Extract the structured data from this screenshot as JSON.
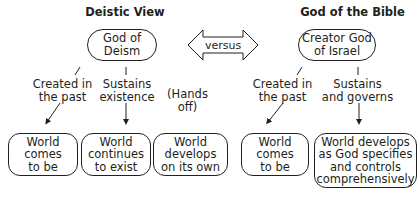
{
  "left": {
    "heading": "Deistic View",
    "god": "God of\nDeism",
    "links": [
      {
        "label": "Created in\nthe past"
      },
      {
        "label": "Sustains\nexistence"
      },
      {
        "label": "(Hands off)"
      }
    ],
    "outcomes": [
      {
        "text": "World\ncomes\nto be"
      },
      {
        "text": "World\ncontinues\nto exist"
      },
      {
        "text": "World\ndevelops\non its own"
      }
    ]
  },
  "comparison": {
    "label": "versus",
    "icon": "double-arrow-icon"
  },
  "right": {
    "heading": "God of the Bible",
    "god": "Creator God\nof Israel",
    "links": [
      {
        "label": "Created in\nthe past"
      },
      {
        "label": "Sustains\nand governs"
      }
    ],
    "outcomes": [
      {
        "text": "World\ncomes\nto be"
      },
      {
        "text": "World develops\nas God specifies\nand controls\ncomprehensively"
      }
    ]
  },
  "colors": {
    "stroke": "#231f20",
    "background": "#ffffff"
  }
}
